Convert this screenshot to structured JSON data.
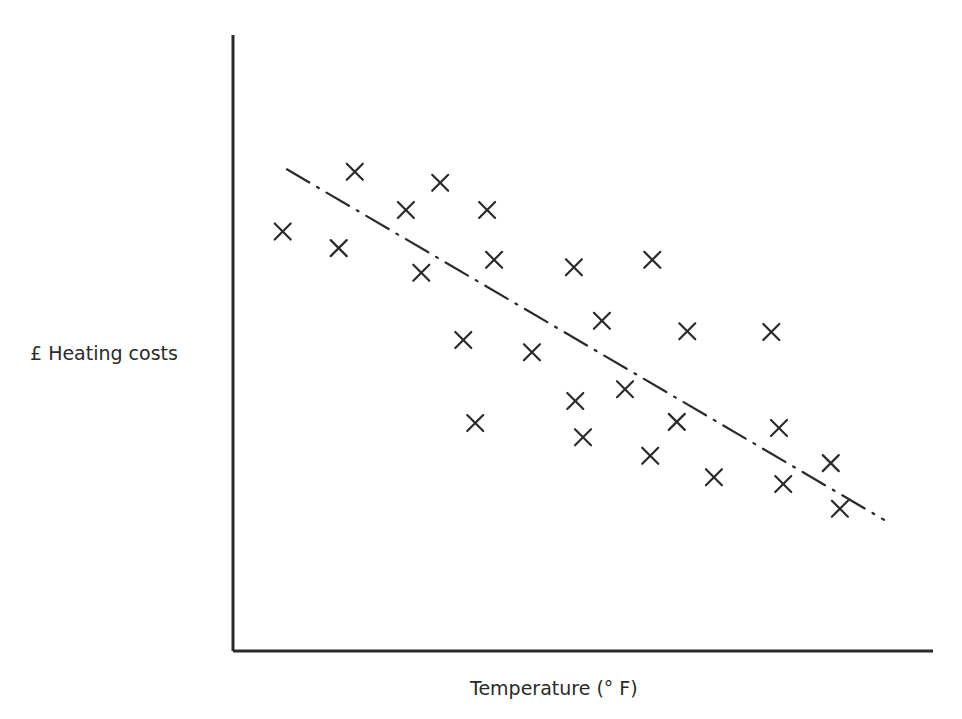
{
  "chart_data": {
    "type": "scatter",
    "title": "",
    "xlabel": "Temperature  (° F)",
    "ylabel": "£  Heating costs",
    "xlim": [
      0,
      100
    ],
    "ylim": [
      0,
      100
    ],
    "grid": false,
    "legend": null,
    "ticks": "none (axes unlabeled)",
    "marker": "x",
    "points": [
      {
        "x": 7.1,
        "y": 68.1
      },
      {
        "x": 17.4,
        "y": 77.8
      },
      {
        "x": 15.1,
        "y": 65.4
      },
      {
        "x": 24.7,
        "y": 71.6
      },
      {
        "x": 29.6,
        "y": 76.0
      },
      {
        "x": 26.9,
        "y": 61.4
      },
      {
        "x": 36.3,
        "y": 71.6
      },
      {
        "x": 37.3,
        "y": 63.5
      },
      {
        "x": 32.9,
        "y": 50.5
      },
      {
        "x": 42.7,
        "y": 48.5
      },
      {
        "x": 34.6,
        "y": 37.0
      },
      {
        "x": 48.7,
        "y": 62.3
      },
      {
        "x": 52.7,
        "y": 53.6
      },
      {
        "x": 59.9,
        "y": 63.5
      },
      {
        "x": 48.9,
        "y": 40.6
      },
      {
        "x": 50.0,
        "y": 34.7
      },
      {
        "x": 56.0,
        "y": 42.5
      },
      {
        "x": 59.6,
        "y": 31.7
      },
      {
        "x": 63.4,
        "y": 37.2
      },
      {
        "x": 64.9,
        "y": 51.9
      },
      {
        "x": 68.7,
        "y": 28.2
      },
      {
        "x": 76.9,
        "y": 51.8
      },
      {
        "x": 78.0,
        "y": 36.2
      },
      {
        "x": 78.6,
        "y": 27.1
      },
      {
        "x": 85.4,
        "y": 30.5
      },
      {
        "x": 86.7,
        "y": 23.1
      }
    ],
    "trend_line": {
      "style": "dash-dot",
      "from": {
        "x": 7.7,
        "y": 78.2
      },
      "to": {
        "x": 93.0,
        "y": 21.3
      },
      "direction": "negative correlation"
    }
  },
  "style": {
    "ink": "#2a2a2a",
    "background": "#ffffff"
  },
  "layout_px": {
    "origin": [
      233,
      651
    ],
    "x_axis_end": 933,
    "y_axis_top": 35,
    "plot_width": 700,
    "plot_height": 616
  }
}
